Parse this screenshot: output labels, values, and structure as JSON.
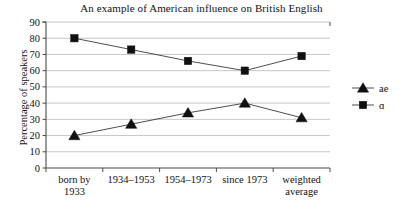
{
  "chart_data": {
    "type": "line",
    "title": "An example of American influence on British English",
    "xlabel": "",
    "ylabel": "Percentage of speakers",
    "ylim": [
      0,
      90
    ],
    "ytick_step": 10,
    "yticks": [
      "90",
      "80",
      "70",
      "60",
      "50",
      "40",
      "30",
      "20",
      "10",
      "0"
    ],
    "grid": true,
    "legend_position": "right",
    "categories": [
      "born by 1933",
      "1934–1953",
      "1954–1973",
      "since 1973",
      "weighted average"
    ],
    "category_lines": [
      [
        "born by",
        "1933"
      ],
      [
        "1934–1953",
        ""
      ],
      [
        "1954–1973",
        ""
      ],
      [
        "since 1973",
        ""
      ],
      [
        "weighted",
        "average"
      ]
    ],
    "series": [
      {
        "name": "ae",
        "marker": "triangle",
        "values": [
          20,
          27,
          34,
          40,
          31
        ]
      },
      {
        "name": "ɑ",
        "marker": "square",
        "values": [
          80,
          73,
          66,
          60,
          69
        ]
      }
    ],
    "colors": {
      "marker": "#101010",
      "line": "#3a3a3a",
      "grid": "#b8b8b8",
      "axis": "#4a4a4a",
      "text": "#111111",
      "background": "#ffffff"
    }
  }
}
